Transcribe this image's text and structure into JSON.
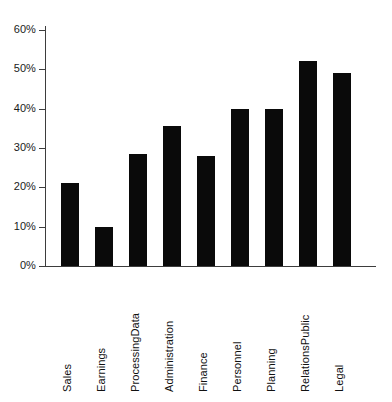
{
  "chart_data": {
    "type": "bar",
    "title": "",
    "subtitle": "",
    "xlabel": "",
    "ylabel": "",
    "categories": [
      "Sales",
      "Earnings",
      "Data Processing",
      "Administration",
      "Finance",
      "Personnel",
      "Planning",
      "Public Relations",
      "Legal"
    ],
    "category_lines": [
      [
        "Sales"
      ],
      [
        "Earnings"
      ],
      [
        "Data",
        "Processing"
      ],
      [
        "Administration"
      ],
      [
        "Finance"
      ],
      [
        "Personnel"
      ],
      [
        "Planning"
      ],
      [
        "Public",
        "Relations"
      ],
      [
        "Legal"
      ]
    ],
    "values": [
      21,
      10,
      28.5,
      35.5,
      28,
      40,
      40,
      52,
      49
    ],
    "value_labels": [
      "21%",
      "10%",
      "28.5%",
      "35.5%",
      "28%",
      "40%",
      "40%",
      "52%",
      "49%"
    ],
    "ylim": [
      0,
      60
    ],
    "ytick_values": [
      0,
      10,
      20,
      30,
      40,
      50,
      60
    ],
    "ytick_labels": [
      "0%",
      "10%",
      "20%",
      "30%",
      "40%",
      "50%",
      "60%"
    ],
    "grid": false,
    "legend": null,
    "legend_position": "none",
    "bar_color": "#0a0a0a",
    "axis_color": "#3d3d3d",
    "background_color": "#ffffff",
    "tick_label_rotation": -90
  }
}
